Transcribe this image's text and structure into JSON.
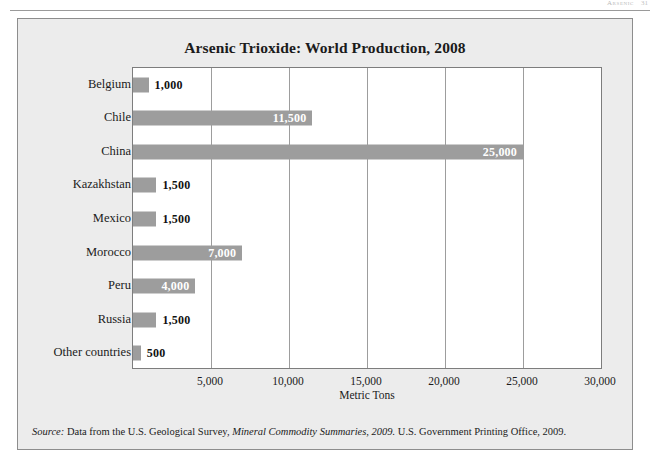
{
  "page_header": {
    "running_head": "Arsenic",
    "page_number": "31"
  },
  "figure": {
    "title": "Arsenic Trioxide: World Production, 2008",
    "source_prefix": "Source:",
    "source_text_1": "Data from the U.S. Geological Survey,",
    "source_italic": "Mineral Commodity Summaries, 2009.",
    "source_text_2": "U.S. Government Printing Office, 2009."
  },
  "colors": {
    "bar": "#9d9d9d",
    "panel_background": "#ececec",
    "plot_background": "#ffffff",
    "grid": "#9d9d9d",
    "border": "#8d8d8d",
    "text": "#1b1b1b",
    "label_inside": "#ffffff"
  },
  "chart_data": {
    "type": "bar",
    "orientation": "horizontal",
    "title": "Arsenic Trioxide: World Production, 2008",
    "xlabel": "Metric Tons",
    "ylabel": "",
    "xlim": [
      0,
      30000
    ],
    "xticks": [
      5000,
      10000,
      15000,
      20000,
      25000,
      30000
    ],
    "xtick_labels": [
      "5,000",
      "10,000",
      "15,000",
      "20,000",
      "25,000",
      "30,000"
    ],
    "grid": true,
    "legend": false,
    "categories": [
      "Belgium",
      "Chile",
      "China",
      "Kazakhstan",
      "Mexico",
      "Morocco",
      "Peru",
      "Russia",
      "Other countries"
    ],
    "values": [
      1000,
      11500,
      25000,
      1500,
      1500,
      7000,
      4000,
      1500,
      500
    ],
    "value_labels": [
      "1,000",
      "11,500",
      "25,000",
      "1,500",
      "1,500",
      "7,000",
      "4,000",
      "1,500",
      "500"
    ],
    "label_placement": [
      "outside",
      "inside",
      "inside",
      "outside",
      "outside",
      "inside",
      "inside",
      "outside",
      "outside"
    ]
  }
}
